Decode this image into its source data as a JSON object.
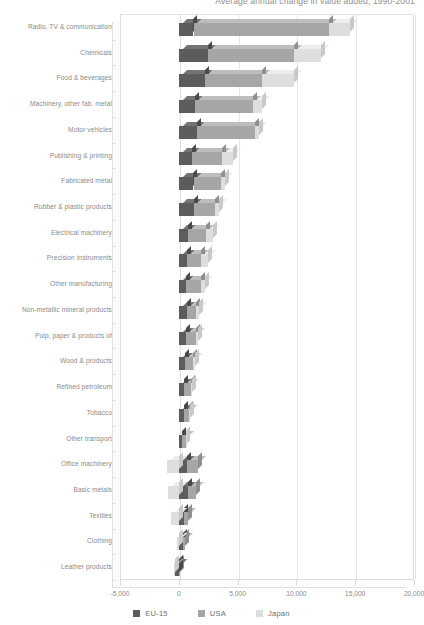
{
  "chart": {
    "title": "Average annual change in value added, 1990-2001"
  },
  "legend": {
    "position": "bottom-center",
    "items": [
      {
        "label": "EU-15",
        "color": "#5c5c5c"
      },
      {
        "label": "USA",
        "color": "#a6a6a6"
      },
      {
        "label": "Japan",
        "color": "#dedede"
      }
    ]
  },
  "axis": {
    "x_ticks": [
      "-5,000",
      "0",
      "5,000",
      "10,000",
      "15,000",
      "20,000"
    ],
    "x_tick_values": [
      -5000,
      0,
      5000,
      10000,
      15000,
      20000
    ],
    "xlabel": "",
    "ylabel": ""
  },
  "chart_data": {
    "type": "bar",
    "orientation": "horizontal",
    "stacked": true,
    "title": "Average annual change in value added, 1990-2001",
    "xlabel": "",
    "ylabel": "",
    "xlim": [
      -5000,
      20000
    ],
    "grid": true,
    "legend_position": "bottom-center",
    "categories": [
      "Radio, TV & communication",
      "Chemicals",
      "Food & beverages",
      "Machinery, other fab. metal",
      "Motor vehicles",
      "Publishing & printing",
      "Fabricated metal",
      "Rubber & plastic products",
      "Electrical machinery",
      "Precision instruments",
      "Other manufacturing",
      "Non-metallic mineral products",
      "Pulp, paper & products of",
      "Wood & products",
      "Refined petroleum",
      "Tobacco",
      "Other transport",
      "Office machinery",
      "Basic metals",
      "Textiles",
      "Clothing",
      "Leather products"
    ],
    "series": [
      {
        "name": "EU-15",
        "color": "#5c5c5c",
        "values": [
          1250,
          2500,
          2200,
          1400,
          1550,
          1100,
          1250,
          1300,
          750,
          700,
          600,
          700,
          600,
          500,
          450,
          400,
          300,
          700,
          750,
          450,
          350,
          -350
        ]
      },
      {
        "name": "USA",
        "color": "#a6a6a6",
        "values": [
          11500,
          7300,
          4900,
          4900,
          4900,
          2600,
          2300,
          1800,
          1600,
          1200,
          1300,
          800,
          850,
          700,
          550,
          450,
          300,
          950,
          700,
          350,
          200,
          100
        ]
      },
      {
        "name": "Japan",
        "color": "#dedede",
        "values": [
          1850,
          2300,
          2700,
          800,
          350,
          900,
          350,
          300,
          550,
          600,
          350,
          250,
          150,
          150,
          100,
          100,
          50,
          -1000,
          -950,
          -650,
          -150,
          -50
        ]
      }
    ]
  }
}
